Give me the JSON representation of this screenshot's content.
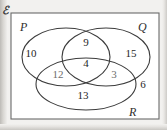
{
  "diagram": {
    "type": "venn-3-set",
    "universal_symbol": "ℰ",
    "universal_label_name": "universal-set-symbol",
    "sets": [
      {
        "key": "P",
        "label": "P",
        "position": "top-left"
      },
      {
        "key": "Q",
        "label": "Q",
        "position": "top-right"
      },
      {
        "key": "R",
        "label": "R",
        "position": "bottom-right"
      }
    ],
    "regions": [
      {
        "key": "P_only",
        "label": "P only",
        "value": "10",
        "x": 31,
        "y": 53
      },
      {
        "key": "PQ",
        "label": "P and Q only",
        "value": "9",
        "x": 86,
        "y": 42
      },
      {
        "key": "Q_only",
        "label": "Q only",
        "value": "15",
        "x": 131,
        "y": 53
      },
      {
        "key": "PQR",
        "label": "P and Q and R",
        "value": "4",
        "x": 86,
        "y": 63
      },
      {
        "key": "PR",
        "label": "P and R only",
        "value": "12",
        "x": 58,
        "y": 74
      },
      {
        "key": "QR",
        "label": "Q and R only",
        "value": "3",
        "x": 114,
        "y": 74
      },
      {
        "key": "R_only",
        "label": "R only",
        "value": "13",
        "x": 83,
        "y": 95
      },
      {
        "key": "outside",
        "label": "outside all sets",
        "value": "6",
        "x": 143,
        "y": 84
      }
    ],
    "colors": {
      "stroke": "#3c3c3c",
      "text": "#1f1f1f",
      "faint_text": "#6e6e6e",
      "background": "#ffffff",
      "paper": "#f2f1ef"
    }
  }
}
